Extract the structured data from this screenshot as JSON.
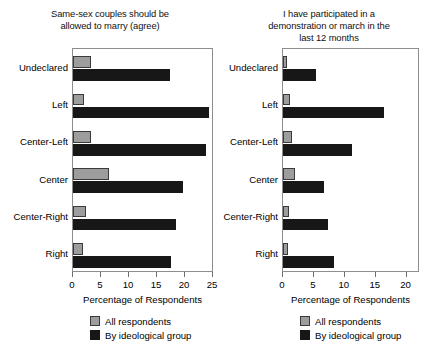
{
  "legend": {
    "all_label": "All respondents",
    "ideological_label": "By ideological group",
    "all_color": "#9d9d9d",
    "ideological_color": "#171717"
  },
  "chart_data": [
    {
      "type": "bar",
      "orientation": "horizontal",
      "panel": "left",
      "title": "Same-sex couples should be allowed to marry (agree)",
      "title_lines": [
        "Same-sex couples should be",
        "allowed to marry (agree)"
      ],
      "xlabel": "Percentage of Respondents",
      "ylabel": "",
      "categories": [
        "Undeclared",
        "Left",
        "Center-Left",
        "Center",
        "Center-Right",
        "Right"
      ],
      "xlim": [
        0,
        25
      ],
      "xticks": [
        0,
        5,
        10,
        15,
        20,
        25
      ],
      "xtick_labels": [
        "0",
        "5",
        "10",
        "15",
        "20",
        "25"
      ],
      "grid": false,
      "legend_position": "below",
      "series": [
        {
          "name": "All respondents",
          "color": "#9d9d9d",
          "values": [
            3.2,
            2.0,
            3.3,
            6.4,
            2.4,
            1.8
          ]
        },
        {
          "name": "By ideological group",
          "color": "#171717",
          "values": [
            17.4,
            24.2,
            23.8,
            19.7,
            18.4,
            17.5
          ]
        }
      ]
    },
    {
      "type": "bar",
      "orientation": "horizontal",
      "panel": "right",
      "title": "I have participated in a demonstration or march in the last 12 months",
      "title_lines": [
        "I have participated in a",
        "demonstration or march in the",
        "last 12 months"
      ],
      "xlabel": "Percentage of Respondents",
      "ylabel": "",
      "categories": [
        "Undeclared",
        "Left",
        "Center-Left",
        "Center",
        "Center-Right",
        "Right"
      ],
      "xlim": [
        0,
        22
      ],
      "xticks": [
        0,
        5,
        10,
        15,
        20
      ],
      "xtick_labels": [
        "0",
        "5",
        "10",
        "15",
        "20"
      ],
      "grid": false,
      "legend_position": "below",
      "series": [
        {
          "name": "All respondents",
          "color": "#9d9d9d",
          "values": [
            0.7,
            1.1,
            1.5,
            2.0,
            0.9,
            0.8
          ]
        },
        {
          "name": "By ideological group",
          "color": "#171717",
          "values": [
            5.3,
            16.4,
            11.2,
            6.6,
            7.3,
            8.3
          ]
        }
      ]
    }
  ]
}
